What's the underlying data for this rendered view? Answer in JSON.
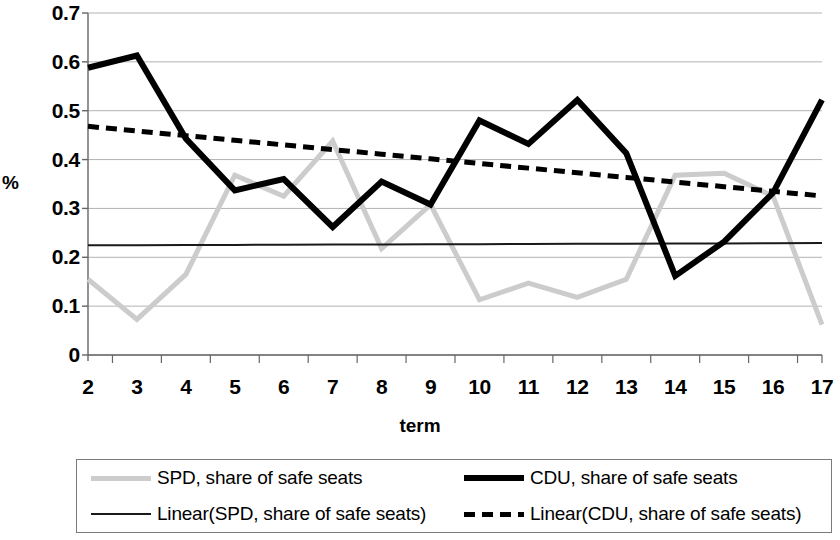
{
  "chart_data": {
    "type": "line",
    "title": "",
    "xlabel": "term",
    "ylabel": "%",
    "x": [
      2,
      3,
      4,
      5,
      6,
      7,
      8,
      9,
      10,
      11,
      12,
      13,
      14,
      15,
      16,
      17
    ],
    "xticklabels": [
      "2",
      "3",
      "4",
      "5",
      "6",
      "7",
      "8",
      "9",
      "10",
      "11",
      "12",
      "13",
      "14",
      "15",
      "16",
      "17"
    ],
    "yticklabels": [
      "0.7",
      "0.6",
      "0.5",
      "0.4",
      "0.3",
      "0.2",
      "0.1",
      "0"
    ],
    "ytickvalues": [
      0.7,
      0.6,
      0.5,
      0.4,
      0.3,
      0.2,
      0.1,
      0
    ],
    "xlim": [
      2,
      17
    ],
    "ylim": [
      0,
      0.7
    ],
    "grid": "horizontal",
    "legend_position": "bottom",
    "series": [
      {
        "name": "SPD, share of safe seats",
        "style": "solid",
        "color": "#cccccc",
        "width": 5,
        "values": [
          0.155,
          0.073,
          0.165,
          0.368,
          0.325,
          0.438,
          0.218,
          0.308,
          0.113,
          0.147,
          0.118,
          0.155,
          0.368,
          0.372,
          0.325,
          0.062
        ]
      },
      {
        "name": "CDU, share of safe seats",
        "style": "solid",
        "color": "#000000",
        "width": 6,
        "values": [
          0.588,
          0.613,
          0.443,
          0.337,
          0.36,
          0.262,
          0.355,
          0.308,
          0.48,
          0.432,
          0.522,
          0.413,
          0.162,
          0.232,
          0.332,
          0.522
        ]
      },
      {
        "name": "Linear(SPD, share of safe seats)",
        "style": "solid",
        "color": "#1a1a1a",
        "width": 2,
        "trend": true,
        "values": [
          0.2245,
          0.2248,
          0.2251,
          0.2254,
          0.2257,
          0.226,
          0.2263,
          0.2266,
          0.2269,
          0.2272,
          0.2275,
          0.2278,
          0.2281,
          0.2284,
          0.2287,
          0.229
        ]
      },
      {
        "name": "Linear(CDU, share of safe seats)",
        "style": "dashed",
        "color": "#000000",
        "width": 5,
        "trend": true,
        "values": [
          0.468,
          0.4585,
          0.449,
          0.4395,
          0.43,
          0.4205,
          0.411,
          0.4015,
          0.392,
          0.3825,
          0.373,
          0.3635,
          0.354,
          0.3445,
          0.335,
          0.3255
        ]
      }
    ]
  },
  "legend": {
    "items": [
      {
        "label": "SPD, share of safe seats",
        "swatch": "spd-line-swatch"
      },
      {
        "label": "CDU, share of safe seats",
        "swatch": "cdu-line-swatch"
      },
      {
        "label": "Linear(SPD, share of safe seats)",
        "swatch": "linear-spd-line-swatch"
      },
      {
        "label": "Linear(CDU, share of safe seats)",
        "swatch": "linear-cdu-line-swatch"
      }
    ]
  },
  "colors": {
    "spd": "#cccccc",
    "cdu": "#000000",
    "linear_spd": "#1a1a1a",
    "linear_cdu": "#000000",
    "grid": "#b3b3b3",
    "axis": "#666666",
    "legend_border": "#7a7a7a"
  }
}
